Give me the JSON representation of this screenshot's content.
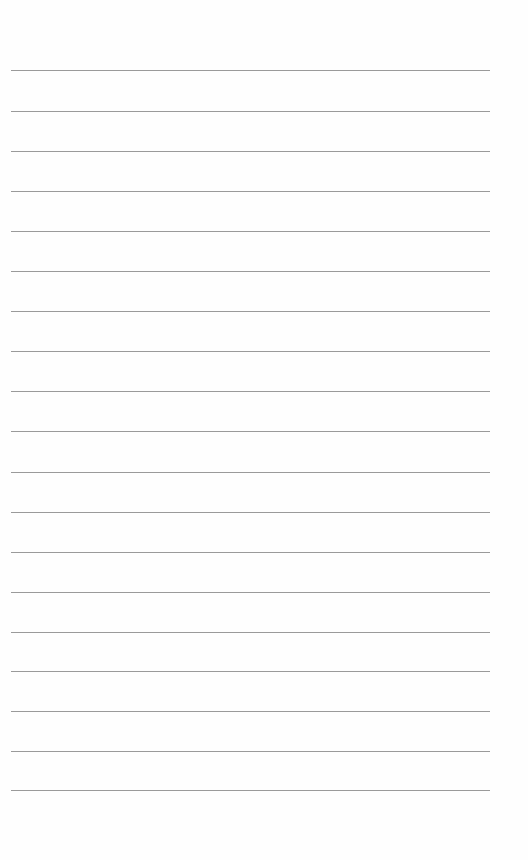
{
  "page": {
    "type": "lined-paper",
    "background_color": "#fefefe",
    "line_color": "#9a9a9a",
    "line_left": 11,
    "line_width": 479,
    "lines": [
      70,
      111,
      151,
      191,
      231,
      271,
      311,
      351,
      391,
      431,
      472,
      512,
      552,
      592,
      632,
      671,
      711,
      751,
      790
    ]
  }
}
